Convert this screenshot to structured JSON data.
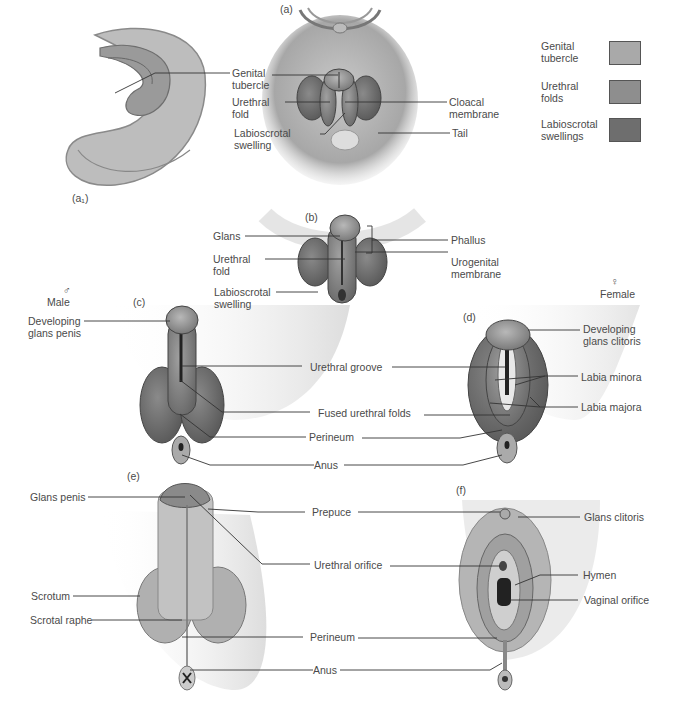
{
  "figure": {
    "panels": {
      "a1": "(a₁)",
      "a": "(a)",
      "b": "(b)",
      "c": "(c)",
      "d": "(d)",
      "e": "(e)",
      "f": "(f)"
    },
    "sex": {
      "male_symbol": "♂",
      "male_label": "Male",
      "female_symbol": "♀",
      "female_label": "Female"
    },
    "legend": [
      {
        "label": "Genital tubercle",
        "color": "#a9a9a9"
      },
      {
        "label": "Urethral folds",
        "color": "#8e8e8e"
      },
      {
        "label": "Labioscrotal swellings",
        "color": "#6e6e6e"
      }
    ],
    "labels_a": {
      "genital_tubercle": "Genital tubercle",
      "urethral_fold": "Urethral fold",
      "labioscrotal_swelling": "Labioscrotal swelling",
      "cloacal_membrane": "Cloacal membrane",
      "tail": "Tail"
    },
    "labels_b": {
      "glans": "Glans",
      "urethral_fold": "Urethral fold",
      "labioscrotal_swelling": "Labioscrotal swelling",
      "phallus": "Phallus",
      "urogenital_membrane": "Urogenital membrane"
    },
    "labels_cd": {
      "developing_glans_penis": "Developing glans penis",
      "developing_glans_clitoris": "Developing glans clitoris",
      "urethral_groove": "Urethral groove",
      "fused_urethral_folds": "Fused urethral folds",
      "perineum": "Perineum",
      "anus": "Anus",
      "labia_minora": "Labia minora",
      "labia_majora": "Labia majora"
    },
    "labels_ef": {
      "glans_penis": "Glans penis",
      "scrotum": "Scrotum",
      "scrotal_raphe": "Scrotal raphe",
      "prepuce": "Prepuce",
      "urethral_orifice": "Urethral orifice",
      "perineum": "Perineum",
      "anus": "Anus",
      "glans_clitoris": "Glans clitoris",
      "hymen": "Hymen",
      "vaginal_orifice": "Vaginal orifice"
    }
  }
}
